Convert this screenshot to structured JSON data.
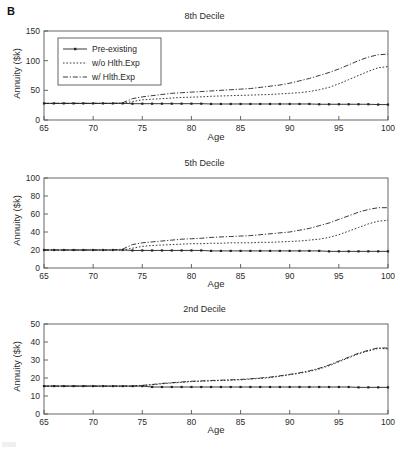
{
  "figure": {
    "panel_label": "B"
  },
  "legend": {
    "items": [
      {
        "label": "Pre-existing",
        "style": "solid-with-markers"
      },
      {
        "label": "w/o Hlth.Exp",
        "style": "dotted"
      },
      {
        "label": "w/ Hlth.Exp",
        "style": "dash-dot"
      }
    ]
  },
  "axis_common": {
    "xlabel": "Age",
    "ylabel": "Annuity ($k)",
    "xticks": [
      65,
      70,
      75,
      80,
      85,
      90,
      95,
      100
    ],
    "xlim": [
      65,
      100
    ]
  },
  "chart_data": [
    {
      "type": "line",
      "title": "8th Decile",
      "xlabel": "Age",
      "ylabel": "Annuity ($k)",
      "xlim": [
        65,
        100
      ],
      "ylim": [
        0,
        150
      ],
      "xticks": [
        65,
        70,
        75,
        80,
        85,
        90,
        95,
        100
      ],
      "yticks": [
        0,
        50,
        100,
        150
      ],
      "grid": false,
      "legend_position": "upper left",
      "x": [
        65,
        66,
        67,
        68,
        69,
        70,
        71,
        72,
        73,
        74,
        75,
        76,
        77,
        78,
        79,
        80,
        81,
        82,
        83,
        84,
        85,
        86,
        87,
        88,
        89,
        90,
        91,
        92,
        93,
        94,
        95,
        96,
        97,
        98,
        99,
        100
      ],
      "series": [
        {
          "name": "Pre-existing",
          "values": [
            28,
            28,
            28,
            28,
            28,
            28,
            28,
            28,
            28,
            27.5,
            27.5,
            27.5,
            27.5,
            27.5,
            27.5,
            27.5,
            27.5,
            27,
            27,
            27,
            27,
            27,
            27,
            27,
            27,
            27,
            27,
            27,
            26.5,
            26.5,
            26.5,
            26.5,
            26.5,
            26.5,
            26,
            26
          ]
        },
        {
          "name": "w/o Hlth.Exp",
          "values": [
            28,
            28,
            28,
            28,
            28,
            28,
            28,
            28,
            28,
            31,
            34,
            35,
            36,
            37,
            38,
            38.5,
            39,
            40,
            40.5,
            41,
            41.5,
            42,
            42.5,
            43,
            44,
            45,
            46,
            48,
            51,
            55,
            61,
            68,
            75,
            82,
            88,
            90
          ]
        },
        {
          "name": "w/ Hlth.Exp",
          "values": [
            28,
            28,
            28,
            28,
            28,
            28,
            28,
            28,
            29,
            36,
            39,
            41,
            43,
            45,
            46,
            47,
            48,
            49,
            50,
            51,
            52,
            53,
            55,
            57,
            59,
            62,
            66,
            70,
            75,
            80,
            86,
            93,
            100,
            106,
            110,
            111
          ]
        }
      ]
    },
    {
      "type": "line",
      "title": "5th Decile",
      "xlabel": "Age",
      "ylabel": "Annuity ($k)",
      "xlim": [
        65,
        100
      ],
      "ylim": [
        0,
        100
      ],
      "xticks": [
        65,
        70,
        75,
        80,
        85,
        90,
        95,
        100
      ],
      "yticks": [
        0,
        20,
        40,
        60,
        80,
        100
      ],
      "grid": false,
      "legend_position": "none",
      "x": [
        65,
        66,
        67,
        68,
        69,
        70,
        71,
        72,
        73,
        74,
        75,
        76,
        77,
        78,
        79,
        80,
        81,
        82,
        83,
        84,
        85,
        86,
        87,
        88,
        89,
        90,
        91,
        92,
        93,
        94,
        95,
        96,
        97,
        98,
        99,
        100
      ],
      "series": [
        {
          "name": "Pre-existing",
          "values": [
            20,
            20,
            20,
            20,
            20,
            20,
            20,
            20,
            20,
            19.5,
            19.5,
            19.5,
            19.5,
            19.5,
            19.5,
            19.5,
            19.5,
            19,
            19,
            19,
            19,
            19,
            19,
            19,
            19,
            19,
            19,
            19,
            19,
            18.5,
            18.5,
            18.5,
            18.5,
            18.5,
            18.5,
            18.5
          ]
        },
        {
          "name": "w/o Hlth.Exp",
          "values": [
            20,
            20,
            20,
            20,
            20,
            20,
            20,
            20,
            20,
            22,
            24,
            25,
            25.5,
            26,
            26.5,
            27,
            27,
            27.5,
            27.5,
            28,
            28,
            28,
            28.5,
            28.5,
            29,
            29.5,
            30,
            31,
            32,
            34,
            37,
            41,
            45,
            49,
            52,
            53
          ]
        },
        {
          "name": "w/ Hlth.Exp",
          "values": [
            20,
            20,
            20,
            20,
            20,
            20,
            20,
            20,
            21,
            26,
            28,
            29,
            30,
            31,
            32,
            32.5,
            33,
            34,
            34.5,
            35,
            35.5,
            36,
            37,
            38,
            39,
            40,
            42,
            44,
            47,
            50,
            54,
            58,
            62,
            65,
            67,
            67
          ]
        }
      ]
    },
    {
      "type": "line",
      "title": "2nd Decile",
      "xlabel": "Age",
      "ylabel": "Annuity ($k)",
      "xlim": [
        65,
        100
      ],
      "ylim": [
        0,
        50
      ],
      "xticks": [
        65,
        70,
        75,
        80,
        85,
        90,
        95,
        100
      ],
      "yticks": [
        0,
        10,
        20,
        30,
        40,
        50
      ],
      "grid": false,
      "legend_position": "none",
      "x": [
        65,
        66,
        67,
        68,
        69,
        70,
        71,
        72,
        73,
        74,
        75,
        76,
        77,
        78,
        79,
        80,
        81,
        82,
        83,
        84,
        85,
        86,
        87,
        88,
        89,
        90,
        91,
        92,
        93,
        94,
        95,
        96,
        97,
        98,
        99,
        100
      ],
      "series": [
        {
          "name": "Pre-existing",
          "values": [
            15.5,
            15.5,
            15.5,
            15.5,
            15.5,
            15.5,
            15.5,
            15.5,
            15.5,
            15.5,
            15.5,
            15,
            15,
            15,
            15,
            15,
            15,
            15,
            15,
            15,
            15,
            15,
            15,
            15,
            15,
            15,
            15,
            15,
            15,
            15,
            15,
            15,
            14.8,
            14.8,
            14.8,
            14.8
          ]
        },
        {
          "name": "w/o Hlth.Exp",
          "values": [
            15.5,
            15.5,
            15.5,
            15.5,
            15.5,
            15.5,
            15.5,
            15.5,
            15.5,
            15.5,
            15.8,
            16.2,
            16.8,
            17.2,
            17.6,
            18,
            18.2,
            18.4,
            18.6,
            18.8,
            19,
            19.4,
            19.8,
            20.2,
            21,
            21.8,
            22.6,
            23.6,
            25,
            26.8,
            29,
            31.2,
            33.4,
            35,
            36.4,
            36.2
          ]
        },
        {
          "name": "w/ Hlth.Exp",
          "values": [
            15.5,
            15.5,
            15.5,
            15.5,
            15.5,
            15.5,
            15.5,
            15.5,
            15.5,
            15.5,
            15.9,
            16.4,
            17,
            17.4,
            17.8,
            18.2,
            18.4,
            18.6,
            18.8,
            19,
            19.2,
            19.6,
            20,
            20.5,
            21.2,
            22,
            22.9,
            24,
            25.4,
            27.2,
            29.4,
            31.6,
            33.8,
            35.4,
            36.8,
            36.6
          ]
        }
      ]
    }
  ]
}
